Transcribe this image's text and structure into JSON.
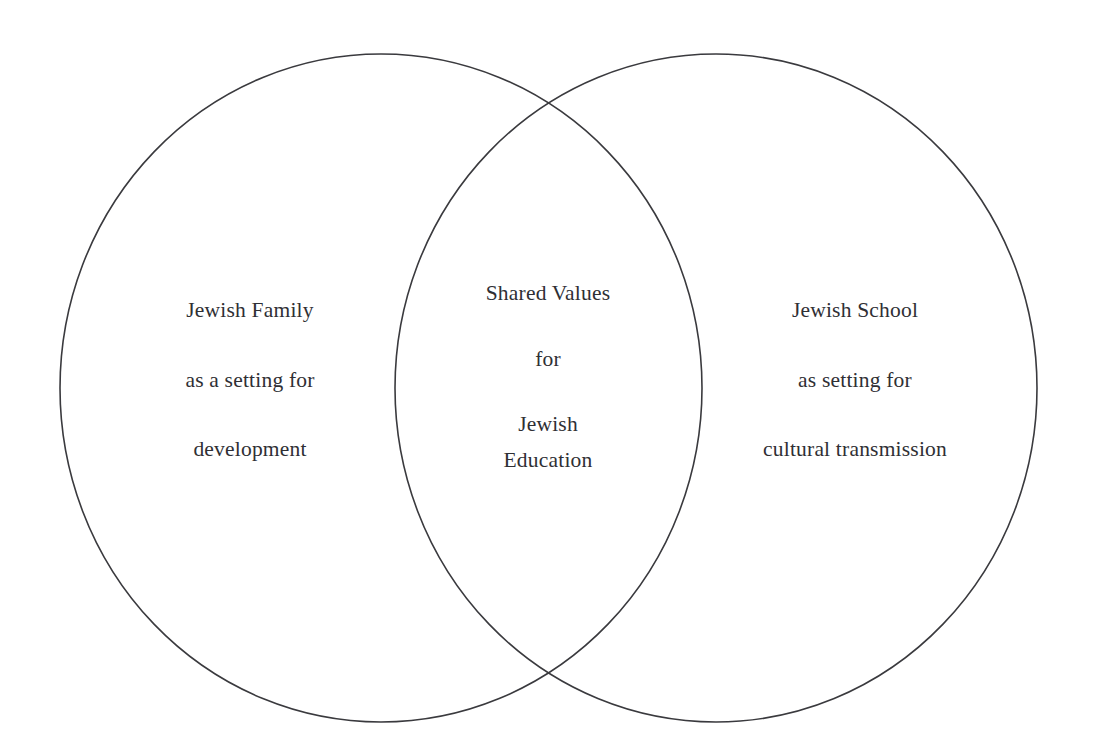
{
  "diagram": {
    "type": "venn",
    "background_color": "#ffffff",
    "stroke_color": "#3a3a3e",
    "text_color": "#2f2f34",
    "sets": [
      {
        "id": "left",
        "role": "left-set",
        "lines": [
          "Jewish Family",
          "as a setting for",
          "development"
        ],
        "shape": {
          "cx": 381,
          "cy": 388,
          "rx": 321,
          "ry": 334
        }
      },
      {
        "id": "intersection",
        "role": "overlap-set",
        "lines": [
          "Shared Values",
          "for",
          "Jewish",
          "Education"
        ],
        "shape": {
          "left": 395,
          "right": 702,
          "top": 102,
          "bottom": 674
        }
      },
      {
        "id": "right",
        "role": "right-set",
        "lines": [
          "Jewish School",
          "as setting for",
          "cultural transmission"
        ],
        "shape": {
          "cx": 716,
          "cy": 388,
          "rx": 321,
          "ry": 334
        }
      }
    ]
  }
}
